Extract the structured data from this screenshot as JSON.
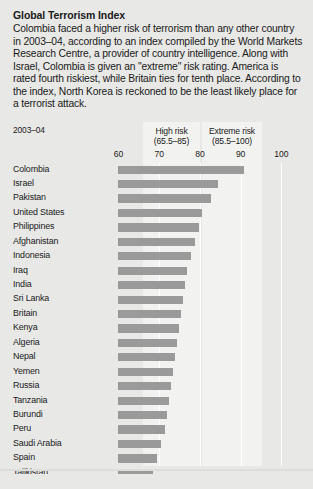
{
  "article": {
    "title": "Global Terrorism Index",
    "body": "Colombia faced a higher risk of terrorism than any other country in 2003–04, according to an index compiled by the World Markets Research Centre, a provider of country intelligence. Along with Israel, Colombia is given an \"extreme\" risk rating. America is rated fourth riskiest, while Britain ties for tenth place. According to the index, North Korea is reckoned to be the least likely place for a terrorist attack."
  },
  "chart_meta": {
    "period_label": "2003–04",
    "band_high_line1": "High risk",
    "band_high_line2": "(65.5–85)",
    "band_extreme_line1": "Extreme risk",
    "band_extreme_line2": "(85.5–100)",
    "bar_color": "#9a9a9a",
    "band_color": "#f2f2f0",
    "page_background": "#e8e8e6"
  },
  "chart_data": {
    "type": "bar",
    "orientation": "horizontal",
    "title": "Global Terrorism Index",
    "subtitle": "2003–04",
    "xlabel": "",
    "ylabel": "",
    "xlim": [
      60,
      103
    ],
    "axis_min": 60,
    "grid": true,
    "gridlines": [
      70,
      80,
      90,
      100
    ],
    "ticks": [
      60,
      70,
      80,
      90,
      100
    ],
    "tick_labels": [
      "60",
      "70",
      "80",
      "90",
      "100"
    ],
    "legend": [
      {
        "name": "High risk",
        "range": "(65.5–85)",
        "min": 65.5,
        "max": 85
      },
      {
        "name": "Extreme risk",
        "range": "(85.5–100)",
        "min": 85.5,
        "max": 100
      }
    ],
    "categories": [
      "Colombia",
      "Israel",
      "Pakistan",
      "United States",
      "Philippines",
      "Afghanistan",
      "Indonesia",
      "Iraq",
      "India",
      "Sri Lanka",
      "Britain",
      "Kenya",
      "Algeria",
      "Nepal",
      "Yemen",
      "Russia",
      "Tanzania",
      "Burundi",
      "Peru",
      "Saudi Arabia",
      "Spain",
      "Tajikistan"
    ],
    "values": [
      91.0,
      84.5,
      82.8,
      80.6,
      79.8,
      79.0,
      78.0,
      77.0,
      76.5,
      76.0,
      75.5,
      75.0,
      74.5,
      74.0,
      73.5,
      73.0,
      72.5,
      72.0,
      71.5,
      70.5,
      69.5,
      68.5
    ]
  }
}
